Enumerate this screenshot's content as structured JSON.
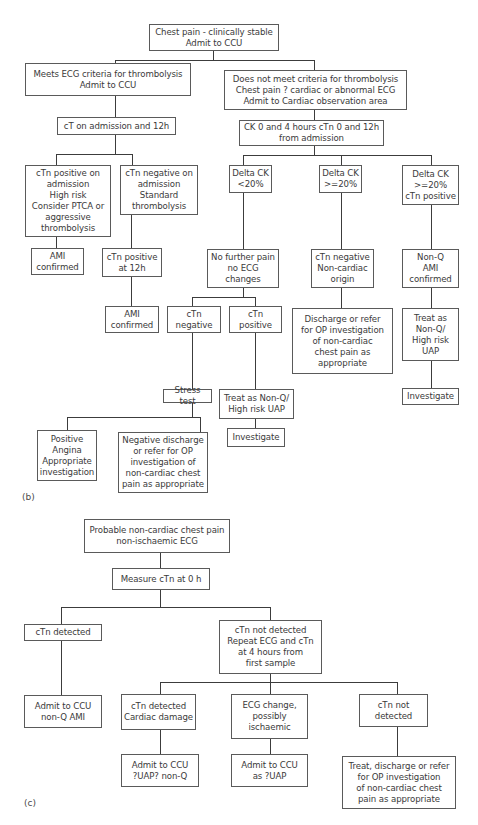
{
  "panel_b": {
    "label": "(b)",
    "nodes": {
      "root": "Chest pain - clinically stable\nAdmit to CCU",
      "meets_ecg": "Meets ECG criteria for thrombolysis\nAdmit to CCU",
      "not_meet": "Does not meet criteria for thrombolysis\nChest pain ? cardiac or abnormal ECG\nAdmit to Cardiac observation area",
      "ct_admission": "cT on admission and 12h",
      "ck_0_4": "CK 0 and 4 hours cTn 0 and 12h\nfrom admission",
      "ctn_pos_adm": "cTn positive on\nadmission\nHigh risk\nConsider PTCA or\naggressive\nthrombolysis",
      "ctn_neg_adm": "cTn negative on\nadmission\nStandard\nthrombolysis",
      "ami_confirmed_1": "AMI\nconfirmed",
      "ctn_pos_12h": "cTn positive\nat 12h",
      "ami_confirmed_2": "AMI\nconfirmed",
      "delta_lt20": "Delta CK\n<20%",
      "delta_ge20": "Delta CK\n>=20%",
      "delta_ge20_ctn": "Delta CK\n>=20%\ncTn positive",
      "no_further_pain": "No further pain\nno ECG\nchanges",
      "ctn_neg_noncardiac": "cTn negative\nNon-cardiac\norigin",
      "nonq_ami": "Non-Q\nAMI\nconfirmed",
      "ctn_negative": "cTn\nnegative",
      "ctn_positive": "cTn\npositive",
      "discharge_refer": "Discharge or refer\nfor OP investigation\nof non-cardiac\nchest pain as\nappropriate",
      "treat_nonq_right": "Treat as\nNon-Q/\nHigh risk\nUAP",
      "stress_test": "Stress test",
      "treat_nonq_mid": "Treat as Non-Q/\nHigh risk UAP",
      "investigate_mid": "Investigate",
      "investigate_right": "Investigate",
      "positive_angina": "Positive\nAngina\nAppropriate\ninvestigation",
      "negative_discharge": "Negative discharge\nor refer for OP\ninvestigation of\nnon-cardiac chest\npain as appropriate"
    }
  },
  "panel_c": {
    "label": "(c)",
    "nodes": {
      "probable": "Probable non-cardiac chest pain\nnon-ischaemic ECG",
      "measure": "Measure cTn at 0 h",
      "ctn_detected": "cTn detected",
      "ctn_not_detected_repeat": "cTn not detected\nRepeat ECG and cTn\nat 4 hours from\nfirst sample",
      "admit_nonq_ami": "Admit to CCU\nnon-Q AMI",
      "ctn_detected_damage": "cTn detected\nCardiac damage",
      "ecg_change": "ECG change,\npossibly\nischaemic",
      "ctn_not_detected": "cTn not\ndetected",
      "admit_uap_nonq": "Admit to CCU\n?UAP? non-Q",
      "admit_as_uap": "Admit to CCU\nas ?UAP",
      "treat_discharge": "Treat, discharge or refer\nfor OP investigation\nof non-cardiac chest\npain as appropriate"
    }
  }
}
